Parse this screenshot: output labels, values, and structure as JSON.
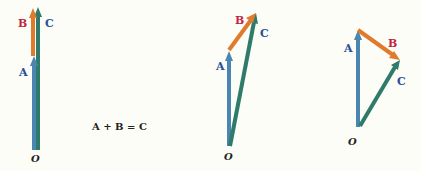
{
  "colors": {
    "vector_a": "#4a86b0",
    "vector_b": "#e07a2c",
    "vector_c": "#2f7a6a",
    "label_a": "#2a4f9a",
    "label_b": "#c0263f",
    "label_c": "#2a4f9a",
    "origin": "#222222"
  },
  "equation": "A + B = C",
  "diagrams": [
    {
      "name": "collinear",
      "origin": {
        "label": "O",
        "x": 35,
        "y": 152
      },
      "vectors": {
        "A": {
          "label": "A",
          "from": [
            34,
            150
          ],
          "to": [
            34,
            57
          ]
        },
        "B": {
          "label": "B",
          "from": [
            34,
            57
          ],
          "to": [
            34,
            8
          ]
        },
        "C": {
          "label": "C",
          "from": [
            38,
            150
          ],
          "to": [
            38,
            8
          ]
        }
      }
    },
    {
      "name": "acute",
      "origin": {
        "label": "O",
        "x": 229,
        "y": 155
      },
      "vectors": {
        "A": {
          "label": "A",
          "from": [
            229,
            146
          ],
          "to": [
            229,
            52
          ]
        },
        "B": {
          "label": "B",
          "from": [
            229,
            50
          ],
          "to": [
            256,
            14
          ]
        },
        "C": {
          "label": "C",
          "from": [
            230,
            146
          ],
          "to": [
            256,
            14
          ]
        }
      }
    },
    {
      "name": "obtuse",
      "origin": {
        "label": "O",
        "x": 357,
        "y": 140
      },
      "vectors": {
        "A": {
          "label": "A",
          "from": [
            358,
            127
          ],
          "to": [
            358,
            31
          ]
        },
        "B": {
          "label": "B",
          "from": [
            358,
            30
          ],
          "to": [
            399,
            60
          ]
        },
        "C": {
          "label": "C",
          "from": [
            360,
            126
          ],
          "to": [
            399,
            61
          ]
        }
      }
    }
  ]
}
